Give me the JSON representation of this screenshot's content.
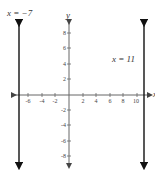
{
  "diagram": {
    "type": "coordinate-plane",
    "axes": {
      "x_label": "x",
      "y_label": "y",
      "x_ticks": [
        "-6",
        "-4",
        "-2",
        "2",
        "4",
        "6",
        "8",
        "10"
      ],
      "y_ticks": [
        "8",
        "6",
        "4",
        "2",
        "-2",
        "-4",
        "-6",
        "-8"
      ]
    },
    "lines": [
      {
        "label": "x = −7",
        "x": -7
      },
      {
        "label": "x = 11",
        "x": 11
      }
    ],
    "colors": {
      "line": "#111111",
      "axis": "#555555",
      "text": "#333333"
    }
  }
}
